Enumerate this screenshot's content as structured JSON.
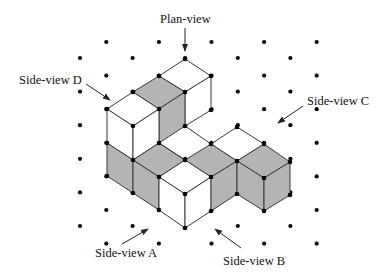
{
  "figure": {
    "colors": {
      "background": "#ffffff",
      "edge": "#3a3a3a",
      "dot": "#000000",
      "shaded_face": "#b4b4b4",
      "white_face": "#ffffff",
      "text": "#111111"
    },
    "grid": {
      "x0": 80,
      "dx": 26.3,
      "columns": 10,
      "even_y0": 58,
      "odd_y0": 42,
      "dy": 33.6,
      "even_rows": 6,
      "odd_rows": 7
    },
    "faces": [
      {
        "name": "top-bar-cube1-top",
        "fill": "white",
        "points": [
          [
            185,
            59
          ],
          [
            211,
            76
          ],
          [
            185,
            92
          ],
          [
            159,
            76
          ]
        ]
      },
      {
        "name": "top-bar-cube2-top",
        "fill": "shaded",
        "points": [
          [
            159,
            76
          ],
          [
            185,
            92
          ],
          [
            159,
            109
          ],
          [
            133,
            92
          ]
        ]
      },
      {
        "name": "top-bar-cube1-right",
        "fill": "white",
        "points": [
          [
            185,
            92
          ],
          [
            211,
            76
          ],
          [
            211,
            110
          ],
          [
            185,
            126
          ]
        ]
      },
      {
        "name": "top-bar-cube2-right",
        "fill": "shaded",
        "points": [
          [
            159,
            109
          ],
          [
            185,
            92
          ],
          [
            185,
            126
          ],
          [
            159,
            143
          ]
        ]
      },
      {
        "name": "corner-cube-top",
        "fill": "white",
        "points": [
          [
            107,
            109
          ],
          [
            133,
            92
          ],
          [
            159,
            109
          ],
          [
            133,
            126
          ]
        ]
      },
      {
        "name": "corner-cube-left",
        "fill": "white",
        "points": [
          [
            107,
            109
          ],
          [
            133,
            126
          ],
          [
            133,
            160
          ],
          [
            107,
            143
          ]
        ]
      },
      {
        "name": "corner-cube-right",
        "fill": "white",
        "points": [
          [
            133,
            126
          ],
          [
            159,
            109
          ],
          [
            159,
            143
          ],
          [
            133,
            160
          ]
        ]
      },
      {
        "name": "lower-left-face",
        "fill": "shaded",
        "points": [
          [
            107,
            143
          ],
          [
            133,
            160
          ],
          [
            133,
            193
          ],
          [
            107,
            176
          ]
        ]
      },
      {
        "name": "lower-cube-a-top",
        "fill": "shaded",
        "points": [
          [
            133,
            160
          ],
          [
            159,
            143
          ],
          [
            185,
            160
          ],
          [
            159,
            177
          ]
        ]
      },
      {
        "name": "lower-cube-a-right",
        "fill": "shaded",
        "points": [
          [
            133,
            160
          ],
          [
            159,
            177
          ],
          [
            159,
            210
          ],
          [
            133,
            193
          ]
        ]
      },
      {
        "name": "back-right-cube-top",
        "fill": "white",
        "points": [
          [
            211,
            144
          ],
          [
            237,
            127
          ],
          [
            264,
            144
          ],
          [
            237,
            161
          ]
        ]
      },
      {
        "name": "mid-cube-top",
        "fill": "shaded",
        "points": [
          [
            185,
            160
          ],
          [
            211,
            144
          ],
          [
            237,
            161
          ],
          [
            211,
            177
          ]
        ]
      },
      {
        "name": "right-cube-top",
        "fill": "shaded",
        "points": [
          [
            237,
            161
          ],
          [
            264,
            144
          ],
          [
            290,
            162
          ],
          [
            264,
            178
          ]
        ]
      },
      {
        "name": "front-cube-top",
        "fill": "white",
        "points": [
          [
            159,
            177
          ],
          [
            185,
            160
          ],
          [
            211,
            177
          ],
          [
            185,
            194
          ]
        ]
      },
      {
        "name": "front-cube-left",
        "fill": "white",
        "points": [
          [
            159,
            177
          ],
          [
            185,
            194
          ],
          [
            185,
            228
          ],
          [
            159,
            210
          ]
        ]
      },
      {
        "name": "front-cube-right",
        "fill": "white",
        "points": [
          [
            185,
            194
          ],
          [
            211,
            177
          ],
          [
            211,
            211
          ],
          [
            185,
            228
          ]
        ]
      },
      {
        "name": "mid-cube-right",
        "fill": "shaded",
        "points": [
          [
            211,
            177
          ],
          [
            237,
            161
          ],
          [
            237,
            194
          ],
          [
            211,
            211
          ]
        ]
      },
      {
        "name": "right-cube-left",
        "fill": "shaded",
        "points": [
          [
            237,
            161
          ],
          [
            264,
            178
          ],
          [
            264,
            211
          ],
          [
            237,
            194
          ]
        ]
      },
      {
        "name": "right-cube-right",
        "fill": "shaded",
        "points": [
          [
            264,
            178
          ],
          [
            290,
            162
          ],
          [
            290,
            195
          ],
          [
            264,
            211
          ]
        ]
      }
    ],
    "extra_edges": [
      [
        [
          159,
          143
        ],
        [
          185,
          160
        ]
      ],
      [
        [
          185,
          126
        ],
        [
          211,
          144
        ]
      ]
    ],
    "vertices": [
      [
        185,
        59
      ],
      [
        211,
        76
      ],
      [
        159,
        76
      ],
      [
        133,
        92
      ],
      [
        185,
        92
      ],
      [
        107,
        109
      ],
      [
        159,
        109
      ],
      [
        211,
        110
      ],
      [
        133,
        126
      ],
      [
        185,
        126
      ],
      [
        107,
        143
      ],
      [
        159,
        143
      ],
      [
        133,
        160
      ],
      [
        185,
        160
      ],
      [
        211,
        144
      ],
      [
        237,
        127
      ],
      [
        264,
        144
      ],
      [
        237,
        161
      ],
      [
        290,
        162
      ],
      [
        107,
        176
      ],
      [
        159,
        177
      ],
      [
        211,
        177
      ],
      [
        264,
        178
      ],
      [
        133,
        193
      ],
      [
        185,
        194
      ],
      [
        237,
        194
      ],
      [
        290,
        195
      ],
      [
        159,
        210
      ],
      [
        211,
        211
      ],
      [
        264,
        211
      ],
      [
        185,
        228
      ]
    ],
    "labels": [
      {
        "id": "plan-view",
        "text": "Plan-view",
        "x": 160,
        "y": 13
      },
      {
        "id": "side-view-d",
        "text": "Side-view D",
        "x": 19,
        "y": 74
      },
      {
        "id": "side-view-c",
        "text": "Side-view C",
        "x": 307,
        "y": 95
      },
      {
        "id": "side-view-a",
        "text": "Side-view A",
        "x": 95,
        "y": 247
      },
      {
        "id": "side-view-b",
        "text": "Side-view B",
        "x": 223,
        "y": 255
      }
    ],
    "arrows": [
      {
        "id": "plan-view-arrow",
        "from": [
          185,
          28
        ],
        "to": [
          185,
          51
        ]
      },
      {
        "id": "side-view-d-arrow",
        "from": [
          86,
          84
        ],
        "to": [
          110,
          100
        ]
      },
      {
        "id": "side-view-c-arrow",
        "from": [
          303,
          106
        ],
        "to": [
          278,
          123
        ]
      },
      {
        "id": "side-view-a-arrow",
        "from": [
          122,
          244
        ],
        "to": [
          148,
          229
        ]
      },
      {
        "id": "side-view-b-arrow",
        "from": [
          241,
          248
        ],
        "to": [
          215,
          229
        ]
      }
    ]
  }
}
